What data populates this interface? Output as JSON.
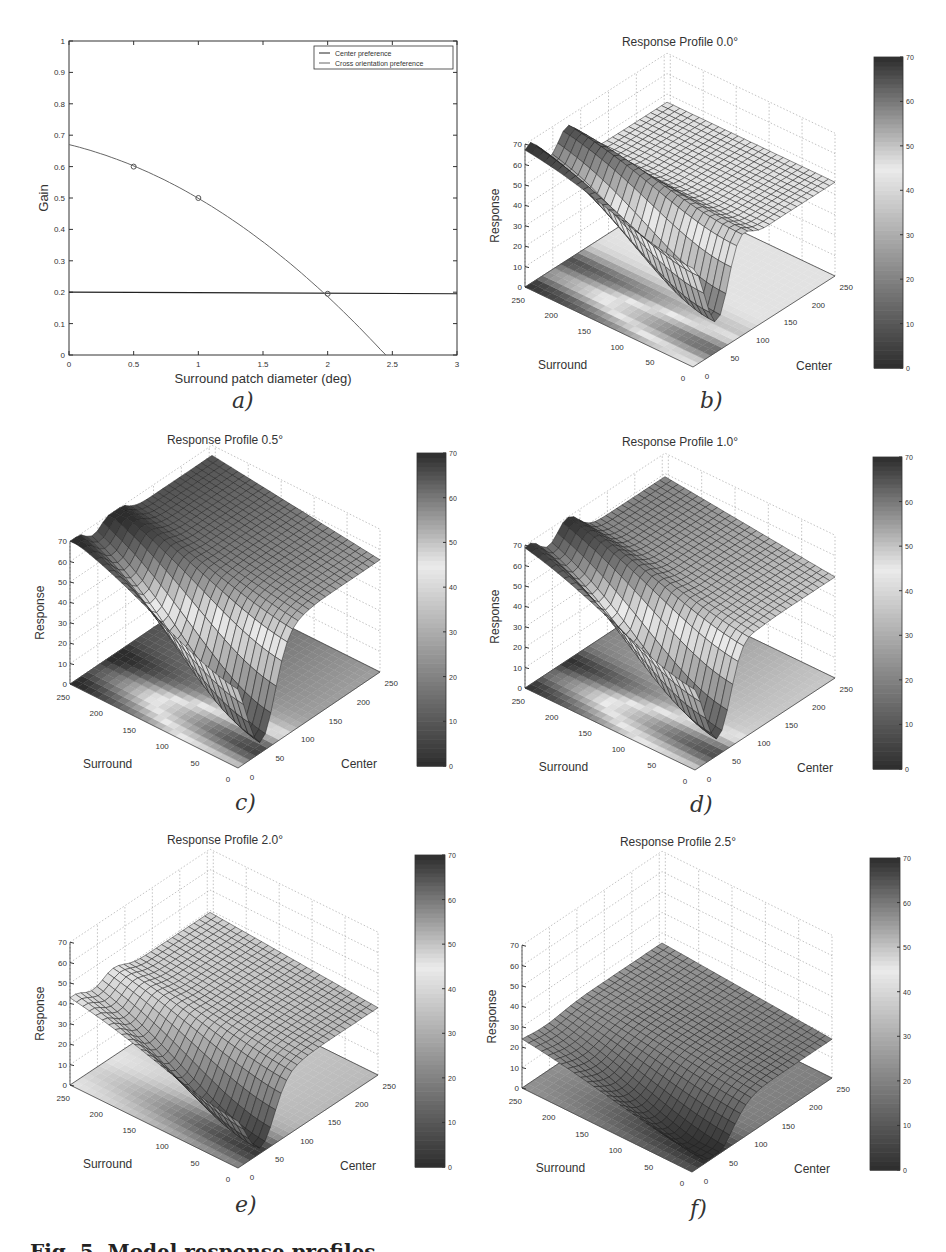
{
  "chart_data": [
    {
      "id": "a",
      "type": "line",
      "panel_label": "a)",
      "title": "",
      "xlabel": "Surround patch diameter (deg)",
      "ylabel": "Gain",
      "xlim": [
        0,
        3
      ],
      "ylim": [
        0,
        1
      ],
      "xticks": [
        "0",
        "0.5",
        "1",
        "1.5",
        "2",
        "2.5",
        "3"
      ],
      "yticks": [
        "0",
        "0.1",
        "0.2",
        "0.3",
        "0.4",
        "0.5",
        "0.6",
        "0.7",
        "0.8",
        "0.9",
        "1"
      ],
      "grid": false,
      "legend_position": "upper right",
      "series": [
        {
          "name": "Center preference",
          "x": [
            0,
            3
          ],
          "y": [
            0.2,
            0.195
          ],
          "color": "#222222"
        },
        {
          "name": "Cross orientation preference",
          "x": [
            0,
            0.5,
            1.0,
            1.5,
            2.0,
            2.45
          ],
          "y": [
            0.67,
            0.6,
            0.5,
            0.37,
            0.2,
            0.0
          ],
          "color": "#666666"
        }
      ],
      "markers": [
        {
          "x": 0.5,
          "y": 0.6
        },
        {
          "x": 1.0,
          "y": 0.5
        },
        {
          "x": 2.0,
          "y": 0.195
        }
      ]
    },
    {
      "id": "b",
      "type": "surface",
      "panel_label": "b)",
      "title": "Response Profile 0.0°",
      "xlabel": "Surround",
      "ylabel": "Center",
      "zlabel": "Response",
      "zlim": [
        0,
        70
      ],
      "zticks": [
        "0",
        "10",
        "20",
        "30",
        "40",
        "50",
        "60",
        "70"
      ],
      "surround_ticks": [
        "0",
        "50",
        "100",
        "150",
        "200",
        "250"
      ],
      "center_ticks": [
        "0",
        "50",
        "100",
        "150",
        "200",
        "250"
      ],
      "colorbar": {
        "min": 0,
        "max": 70,
        "ticks": [
          "0",
          "10",
          "20",
          "30",
          "40",
          "50",
          "60",
          "70"
        ]
      },
      "surface": {
        "base": 46,
        "valley_depth": 46,
        "peak_left": 22,
        "peak_right": 26,
        "surround_slope": 0
      }
    },
    {
      "id": "c",
      "type": "surface",
      "panel_label": "c)",
      "title": "Response Profile 0.5°",
      "xlabel": "Surround",
      "ylabel": "Center",
      "zlabel": "Response",
      "zlim": [
        0,
        70
      ],
      "zticks": [
        "0",
        "10",
        "20",
        "30",
        "40",
        "50",
        "60",
        "70"
      ],
      "surround_ticks": [
        "0",
        "50",
        "100",
        "150",
        "200",
        "250"
      ],
      "center_ticks": [
        "0",
        "50",
        "100",
        "150",
        "200",
        "250"
      ],
      "colorbar": {
        "min": 0,
        "max": 70,
        "ticks": [
          "0",
          "10",
          "20",
          "30",
          "40",
          "50",
          "60",
          "70"
        ]
      },
      "surface": {
        "base": 60,
        "valley_depth": 56,
        "peak_left": 10,
        "peak_right": 10,
        "surround_slope": 10
      }
    },
    {
      "id": "d",
      "type": "surface",
      "panel_label": "d)",
      "title": "Response Profile 1.0°",
      "xlabel": "Surround",
      "ylabel": "Center",
      "zlabel": "Response",
      "zlim": [
        0,
        70
      ],
      "zticks": [
        "0",
        "10",
        "20",
        "30",
        "40",
        "50",
        "60",
        "70"
      ],
      "surround_ticks": [
        "0",
        "50",
        "100",
        "150",
        "200",
        "250"
      ],
      "center_ticks": [
        "0",
        "50",
        "100",
        "150",
        "200",
        "250"
      ],
      "colorbar": {
        "min": 0,
        "max": 70,
        "ticks": [
          "0",
          "10",
          "20",
          "30",
          "40",
          "50",
          "60",
          "70"
        ]
      },
      "surface": {
        "base": 54,
        "valley_depth": 50,
        "peak_left": 14,
        "peak_right": 14,
        "surround_slope": 9
      }
    },
    {
      "id": "e",
      "type": "surface",
      "panel_label": "e)",
      "title": "Response Profile 2.0°",
      "xlabel": "Surround",
      "ylabel": "Center",
      "zlabel": "Response",
      "zlim": [
        0,
        70
      ],
      "zticks": [
        "0",
        "10",
        "20",
        "30",
        "40",
        "50",
        "60",
        "70"
      ],
      "surround_ticks": [
        "0",
        "50",
        "100",
        "150",
        "200",
        "250"
      ],
      "center_ticks": [
        "0",
        "50",
        "100",
        "150",
        "200",
        "250"
      ],
      "colorbar": {
        "min": 0,
        "max": 70,
        "ticks": [
          "0",
          "10",
          "20",
          "30",
          "40",
          "50",
          "60",
          "70"
        ]
      },
      "surface": {
        "base": 36,
        "valley_depth": 34,
        "peak_left": 6,
        "peak_right": 6,
        "surround_slope": 6
      }
    },
    {
      "id": "f",
      "type": "surface",
      "panel_label": "f)",
      "title": "Response Profile 2.5°",
      "xlabel": "Surround",
      "ylabel": "Center",
      "zlabel": "Response",
      "zlim": [
        0,
        70
      ],
      "zticks": [
        "0",
        "10",
        "20",
        "30",
        "40",
        "50",
        "60",
        "70"
      ],
      "surround_ticks": [
        "0",
        "50",
        "100",
        "150",
        "200",
        "250"
      ],
      "center_ticks": [
        "0",
        "50",
        "100",
        "150",
        "200",
        "250"
      ],
      "colorbar": {
        "min": 0,
        "max": 70,
        "ticks": [
          "0",
          "10",
          "20",
          "30",
          "40",
          "50",
          "60",
          "70"
        ]
      },
      "surface": {
        "base": 22,
        "valley_depth": 20,
        "peak_left": 0,
        "peak_right": 0,
        "surround_slope": 6
      }
    }
  ],
  "caption": "Fig. 5. Model response profiles"
}
